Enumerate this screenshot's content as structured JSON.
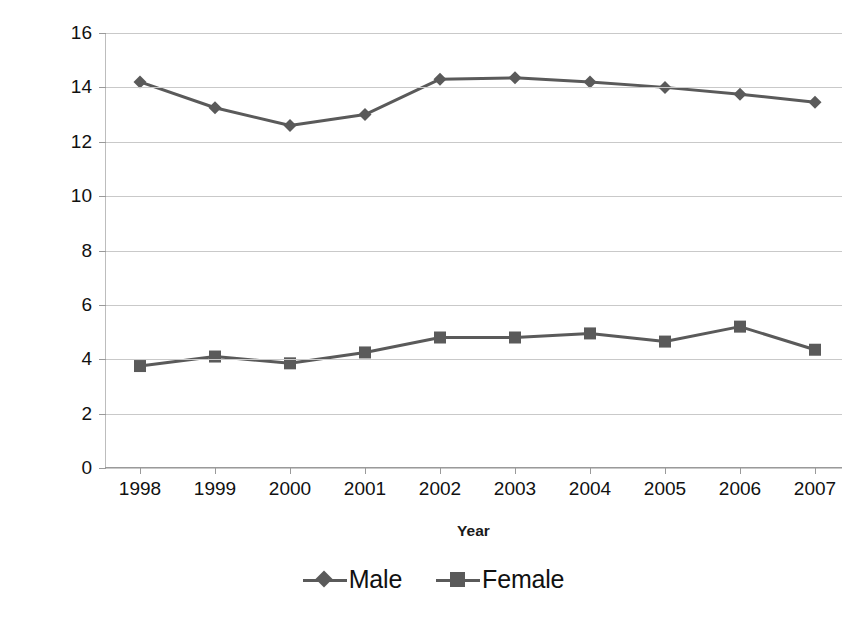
{
  "chart_data": {
    "type": "line",
    "title": "",
    "xlabel": "Year",
    "ylabel": "Positive HIV Test Rate/100,000 (adults)",
    "categories": [
      "1998",
      "1999",
      "2000",
      "2001",
      "2002",
      "2003",
      "2004",
      "2005",
      "2006",
      "2007"
    ],
    "ylim": [
      0,
      16
    ],
    "ytick_values": [
      "16",
      "14",
      "12",
      "10",
      "8",
      "6",
      "4",
      "2",
      "0"
    ],
    "ytick_step": 2,
    "grid": true,
    "legend_position": "bottom",
    "series": [
      {
        "name": "Male",
        "marker": "diamond",
        "color": "#5a5a5a",
        "values": [
          14.2,
          13.25,
          12.6,
          13.0,
          14.3,
          14.35,
          14.2,
          14.0,
          13.75,
          13.45
        ]
      },
      {
        "name": "Female",
        "marker": "square",
        "color": "#5a5a5a",
        "values": [
          3.75,
          4.1,
          3.85,
          4.25,
          4.8,
          4.8,
          4.95,
          4.65,
          5.2,
          4.35
        ]
      }
    ]
  },
  "colors": {
    "series": "#5a5a5a",
    "grid": "#c9c9c9",
    "axis": "#9a9a9a",
    "text": "#111111",
    "background": "#ffffff"
  }
}
